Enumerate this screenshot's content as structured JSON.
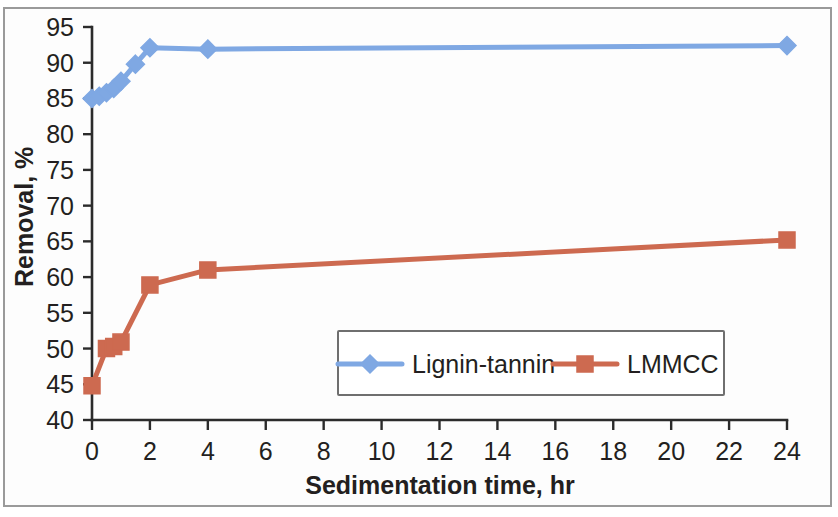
{
  "figure": {
    "background_color": "#ffffff",
    "frame_color": "#9a9a9a"
  },
  "chart_data": {
    "type": "line",
    "title": "",
    "subtitle": "",
    "xlabel": "Sedimentation time, hr",
    "ylabel": "Removal, %",
    "xlim": [
      0,
      24
    ],
    "ylim": [
      40,
      95
    ],
    "xticks": [
      0,
      2,
      4,
      6,
      8,
      10,
      12,
      14,
      16,
      18,
      20,
      22,
      24
    ],
    "xtick_labels": [
      "0",
      "2",
      "4",
      "6",
      "8",
      "10",
      "12",
      "14",
      "16",
      "18",
      "20",
      "22",
      "24"
    ],
    "yticks": [
      40,
      45,
      50,
      55,
      60,
      65,
      70,
      75,
      80,
      85,
      90,
      95
    ],
    "ytick_labels": [
      "40",
      "45",
      "50",
      "55",
      "60",
      "65",
      "70",
      "75",
      "80",
      "85",
      "90",
      "95"
    ],
    "grid": false,
    "legend_position": "inside lower center",
    "series": [
      {
        "name": "Lignin-tannin",
        "color": "#7fa8e3",
        "marker": "diamond",
        "x": [
          0,
          0.25,
          0.5,
          0.75,
          1,
          1.5,
          2,
          4,
          24
        ],
        "y": [
          85.0,
          85.3,
          85.8,
          86.4,
          87.4,
          89.8,
          92.1,
          91.9,
          92.4
        ]
      },
      {
        "name": "LMMCC",
        "color": "#cd6a50",
        "marker": "square",
        "x": [
          0,
          0.5,
          0.75,
          1,
          2,
          4,
          24
        ],
        "y": [
          44.8,
          50.0,
          50.3,
          50.9,
          58.9,
          61.0,
          65.2
        ]
      }
    ]
  },
  "legend": {
    "entries": [
      {
        "label": "Lignin-tannin",
        "color": "#7fa8e3",
        "marker": "diamond"
      },
      {
        "label": "LMMCC",
        "color": "#cd6a50",
        "marker": "square"
      }
    ]
  }
}
